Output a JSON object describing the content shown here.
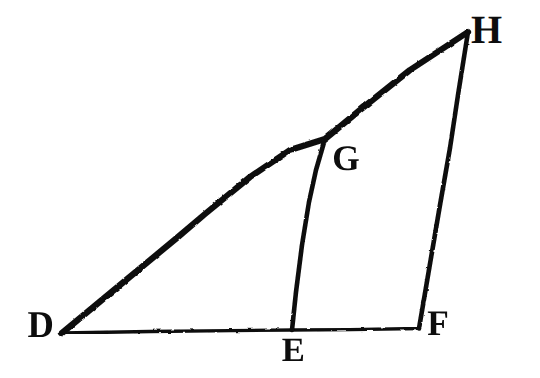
{
  "figure": {
    "kind": "geometry-diagram",
    "background_color": "#ffffff",
    "ink_color": "#0d0d0d",
    "canvas": {
      "width": 540,
      "height": 378
    },
    "points": [
      {
        "id": "D",
        "label": "D",
        "x": 62,
        "y": 333,
        "label_x": 27,
        "label_y": 306
      },
      {
        "id": "E",
        "label": "E",
        "x": 292,
        "y": 330,
        "label_x": 282,
        "label_y": 334
      },
      {
        "id": "F",
        "label": "F",
        "x": 419,
        "y": 328,
        "label_x": 427,
        "label_y": 305
      },
      {
        "id": "G",
        "label": "G",
        "x": 325,
        "y": 139,
        "label_x": 332,
        "label_y": 140
      },
      {
        "id": "H",
        "label": "H",
        "x": 468,
        "y": 32,
        "label_x": 471,
        "label_y": 10
      }
    ],
    "segments": [
      {
        "id": "DF",
        "from": "D",
        "to": "F",
        "stroke_width": 3.4,
        "description": "baseline from D through E to F"
      },
      {
        "id": "DH",
        "from": "D",
        "to": "H",
        "stroke_width": 6.2,
        "description": "hypotenuse from D through G to H"
      },
      {
        "id": "FH",
        "from": "F",
        "to": "H",
        "stroke_width": 4.6,
        "description": "right side from F to H"
      },
      {
        "id": "EG",
        "from": "E",
        "to": "G",
        "stroke_width": 4.6,
        "description": "internal segment from E to G"
      }
    ]
  }
}
